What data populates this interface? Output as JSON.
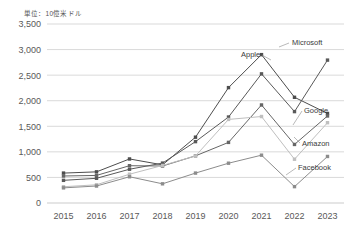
{
  "chart_data": {
    "type": "line",
    "title": "",
    "unit_label": "単位：10億米ドル",
    "xlabel": "",
    "ylabel": "",
    "categories": [
      "2015",
      "2016",
      "2017",
      "2018",
      "2019",
      "2020",
      "2021",
      "2022",
      "2023"
    ],
    "ylim": [
      0,
      3500
    ],
    "yticks": [
      "0",
      "500",
      "1,000",
      "1,500",
      "2,000",
      "2,500",
      "3,000",
      "3,500"
    ],
    "ytick_values": [
      0,
      500,
      1000,
      1500,
      2000,
      2500,
      3000,
      3500
    ],
    "grid": true,
    "legend_position": "inline-right-labels",
    "series": [
      {
        "name": "Apple",
        "color": "#4d4d4d",
        "values": [
          585,
          609,
          861,
          746,
          1287,
          2256,
          2901,
          2067,
          1751
        ]
      },
      {
        "name": "Microsoft",
        "color": "#595959",
        "values": [
          443,
          483,
          660,
          780,
          1200,
          1681,
          2525,
          1787,
          2794
        ]
      },
      {
        "name": "Google",
        "color": "#666666",
        "values": [
          528,
          539,
          729,
          723,
          922,
          1185,
          1917,
          1145,
          1702
        ]
      },
      {
        "name": "Amazon",
        "color": "#bfbfbf",
        "values": [
          318,
          356,
          563,
          734,
          920,
          1634,
          1691,
          856,
          1570
        ]
      },
      {
        "name": "Facebook",
        "color": "#8c8c8c",
        "values": [
          296,
          332,
          513,
          375,
          585,
          778,
          935,
          320,
          910
        ]
      }
    ],
    "annotations": [
      {
        "text": "Apple",
        "series": "Apple"
      },
      {
        "text": "Microsoft",
        "series": "Microsoft"
      },
      {
        "text": "Google",
        "series": "Google"
      },
      {
        "text": "Amazon",
        "series": "Amazon"
      },
      {
        "text": "Facebook",
        "series": "Facebook"
      }
    ]
  }
}
